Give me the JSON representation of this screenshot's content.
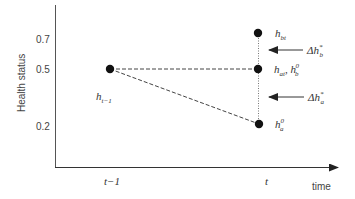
{
  "diagram": {
    "type": "health-status-transition",
    "y_axis": {
      "label": "Health status",
      "ticks": [
        {
          "label": "0.7",
          "value": 0.7
        },
        {
          "label": "0.5",
          "value": 0.5
        },
        {
          "label": "0.2",
          "value": 0.2
        }
      ]
    },
    "x_axis": {
      "label": "time",
      "ticks": [
        {
          "label": "t−1"
        },
        {
          "label": "t"
        }
      ]
    },
    "points": [
      {
        "id": "h_prev",
        "label_main": "h",
        "label_sub": "t−1",
        "time": "t−1",
        "value": 0.5
      },
      {
        "id": "h_bt",
        "label_main": "h",
        "label_sub": "bt",
        "time": "t",
        "value": 0.7
      },
      {
        "id": "h_at",
        "label_main": "h",
        "label_sub": "at",
        "label_extra_main": "h",
        "label_extra_sup": "0",
        "label_extra_sub": "b",
        "time": "t",
        "value": 0.5
      },
      {
        "id": "h_a0",
        "label_main": "h",
        "label_sup": "0",
        "label_sub": "a",
        "time": "t",
        "value": 0.2
      }
    ],
    "arrows": [
      {
        "id": "delta_hb",
        "prefix": "Δh",
        "sup": "*",
        "sub": "b"
      },
      {
        "id": "delta_ha",
        "prefix": "Δh",
        "sup": "*",
        "sub": "a"
      }
    ],
    "colors": {
      "axis": "#333333",
      "point": "#111111",
      "dashed": "#444444",
      "dotted": "#777777",
      "arrow": "#333333"
    }
  }
}
